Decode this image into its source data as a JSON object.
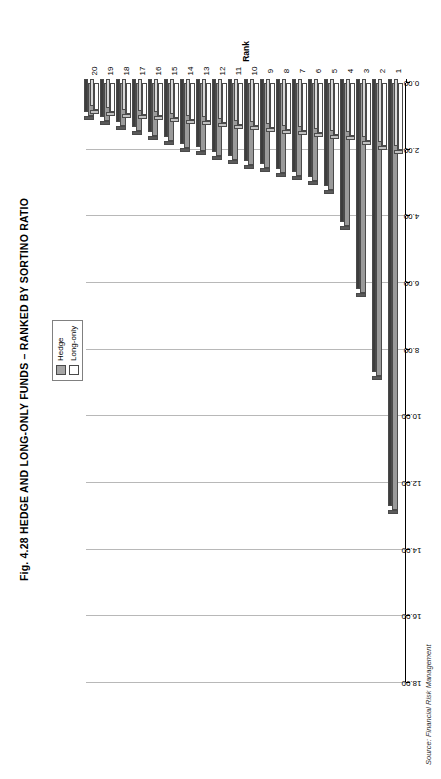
{
  "figure": {
    "title": "Fig. 4.28  HEDGE AND LONG-ONLY FUNDS – RANKED BY SORTINO RATIO",
    "source": "Source: Financial Risk Management"
  },
  "legend": {
    "position": "top-right",
    "entries": [
      {
        "label": "Hedge",
        "color": "#9a9a9a",
        "swatch": "sw-hedge"
      },
      {
        "label": "Long-only",
        "color": "#ffffff",
        "swatch": "sw-long"
      }
    ]
  },
  "chart_data": {
    "type": "bar",
    "orientation": "horizontal",
    "title": "Fig. 4.28  HEDGE AND LONG-ONLY FUNDS – RANKED BY SORTINO RATIO",
    "xlabel": "Sortino ratio",
    "ylabel": "Rank",
    "grid": true,
    "legend_position": "top-right",
    "value_axis": {
      "label": "Sortino ratio",
      "min": 0.0,
      "max": 18.0,
      "tick_step": 2.0,
      "tick_labels": [
        "0.00",
        "2.00",
        "4.00",
        "6.00",
        "8.00",
        "10.00",
        "12.00",
        "14.00",
        "16.00",
        "18.00"
      ],
      "tick_values": [
        0,
        2,
        4,
        6,
        8,
        10,
        12,
        14,
        16,
        18
      ]
    },
    "category_axis": {
      "label": "Rank",
      "categories": [
        "1",
        "2",
        "3",
        "4",
        "5",
        "6",
        "7",
        "8",
        "9",
        "10",
        "11",
        "12",
        "13",
        "14",
        "15",
        "16",
        "17",
        "18",
        "19",
        "20"
      ]
    },
    "categories": [
      "1",
      "2",
      "3",
      "4",
      "5",
      "6",
      "7",
      "8",
      "9",
      "10",
      "11",
      "12",
      "13",
      "14",
      "15",
      "16",
      "17",
      "18",
      "19",
      "20"
    ],
    "series": [
      {
        "name": "Hedge",
        "color": "#9a9a9a",
        "values": [
          12.8,
          8.8,
          6.3,
          4.3,
          3.2,
          2.95,
          2.8,
          2.7,
          2.55,
          2.45,
          2.3,
          2.2,
          2.05,
          1.95,
          1.75,
          1.6,
          1.45,
          1.3,
          1.15,
          1.0
        ]
      },
      {
        "name": "Long-only",
        "color": "#ffffff",
        "values": [
          2.0,
          1.9,
          1.75,
          1.6,
          1.55,
          1.5,
          1.45,
          1.4,
          1.35,
          1.3,
          1.25,
          1.2,
          1.15,
          1.1,
          1.05,
          1.0,
          0.95,
          0.92,
          0.88,
          0.8
        ]
      }
    ]
  }
}
